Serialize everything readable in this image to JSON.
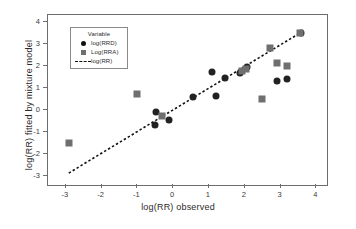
{
  "chart_data": {
    "type": "scatter",
    "title": "",
    "xlabel": "log(RR) observed",
    "ylabel": "log(RR) fitted by mixture model",
    "xlim": [
      -3.5,
      4.3
    ],
    "ylim": [
      -3.4,
      4.3
    ],
    "xticks": [
      -3,
      -2,
      -1,
      0,
      1,
      2,
      3,
      4
    ],
    "xticklabels": [
      "-3",
      "-2",
      "-1",
      "0",
      "1",
      "2",
      "3",
      "4"
    ],
    "yticks": [
      -3,
      -2,
      -1,
      0,
      1,
      2,
      3,
      4
    ],
    "yticklabels": [
      "-3",
      "-2",
      "-1",
      "0",
      "1",
      "2",
      "3",
      "4"
    ],
    "grid": false,
    "legend": {
      "title": "Variable",
      "position": "upper-left-inside",
      "entries": [
        {
          "label": "log(RRD)",
          "marker": "circle",
          "color": "#111111"
        },
        {
          "label": "Log(RRA)",
          "marker": "square",
          "color": "#6f6f6f"
        },
        {
          "label": "log(RR)",
          "marker": "dashed-line",
          "color": "#111111"
        }
      ]
    },
    "reference_line": {
      "name": "log(RR)",
      "style": "dashed",
      "color": "#111111",
      "x_start": -2.92,
      "y_start": -2.86,
      "x_end": 3.58,
      "y_end": 3.52
    },
    "series": [
      {
        "name": "log(RRD)",
        "marker": "circle",
        "color": "#222222",
        "points": [
          {
            "x": -0.47,
            "y": -0.09
          },
          {
            "x": -0.52,
            "y": -0.66
          },
          {
            "x": -0.12,
            "y": -0.45
          },
          {
            "x": 0.55,
            "y": 0.57
          },
          {
            "x": 1.08,
            "y": 1.74
          },
          {
            "x": 1.2,
            "y": 0.65
          },
          {
            "x": 1.45,
            "y": 1.45
          },
          {
            "x": 1.88,
            "y": 1.66
          },
          {
            "x": 2.05,
            "y": 1.95
          },
          {
            "x": 2.9,
            "y": 1.3
          },
          {
            "x": 3.19,
            "y": 1.38
          },
          {
            "x": 3.56,
            "y": 3.48
          }
        ]
      },
      {
        "name": "Log(RRA)",
        "marker": "square",
        "color": "#6f6f6f",
        "points": [
          {
            "x": -2.9,
            "y": -1.5
          },
          {
            "x": -1.01,
            "y": 0.72
          },
          {
            "x": -0.3,
            "y": -0.28
          },
          {
            "x": 1.92,
            "y": 1.76
          },
          {
            "x": 2.04,
            "y": 1.84
          },
          {
            "x": 2.72,
            "y": 2.82
          },
          {
            "x": 2.47,
            "y": 0.51
          },
          {
            "x": 2.9,
            "y": 2.14
          },
          {
            "x": 3.19,
            "y": 1.97
          },
          {
            "x": 3.55,
            "y": 3.5
          }
        ]
      }
    ]
  }
}
